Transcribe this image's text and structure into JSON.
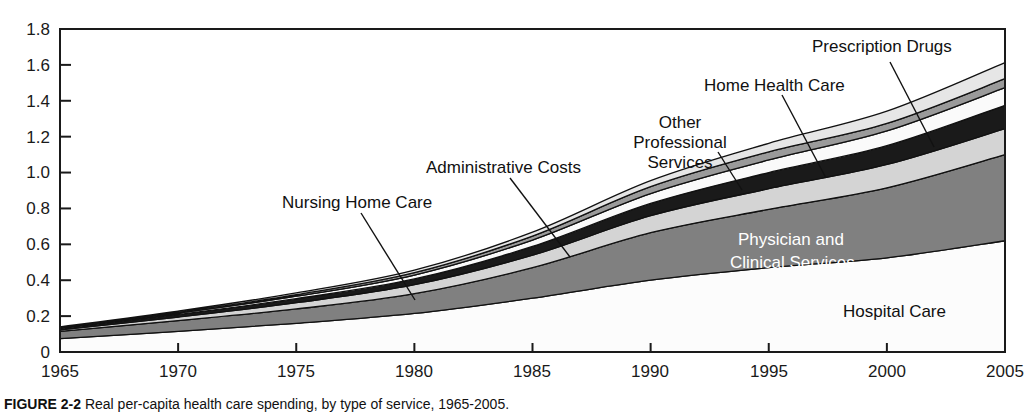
{
  "caption": {
    "figure_number": "FIGURE 2-2",
    "text": "Real per-capita health care spending, by type of service, 1965-2005."
  },
  "chart_data": {
    "type": "area",
    "stacked": true,
    "title": "",
    "xlabel": "",
    "ylabel": "",
    "xlim": [
      1965,
      2005
    ],
    "ylim": [
      0,
      1.8
    ],
    "grid": false,
    "legend_position": "in-plot annotations",
    "x_ticks": [
      "1965",
      "1970",
      "1975",
      "1980",
      "1985",
      "1990",
      "1995",
      "2000",
      "2005"
    ],
    "y_ticks": [
      "0",
      "0.2",
      "0.4",
      "0.6",
      "0.8",
      "1.0",
      "1.2",
      "1.4",
      "1.6",
      "1.8"
    ],
    "x": [
      1965,
      1970,
      1975,
      1980,
      1985,
      1990,
      1995,
      2000,
      2005
    ],
    "series": [
      {
        "name": "Hospital Care",
        "color": "#fcfcfc",
        "values": [
          0.075,
          0.115,
          0.16,
          0.215,
          0.3,
          0.4,
          0.47,
          0.525,
          0.62
        ]
      },
      {
        "name": "Physician and Clinical Services",
        "color": "#808080",
        "values": [
          0.04,
          0.06,
          0.08,
          0.11,
          0.17,
          0.265,
          0.325,
          0.39,
          0.48
        ]
      },
      {
        "name": "Nursing Home Care",
        "color": "#d4d4d4",
        "values": [
          0.008,
          0.02,
          0.035,
          0.05,
          0.07,
          0.095,
          0.115,
          0.13,
          0.145
        ]
      },
      {
        "name": "Administrative Costs",
        "color": "#1a1a1a",
        "values": [
          0.007,
          0.014,
          0.022,
          0.032,
          0.048,
          0.068,
          0.09,
          0.105,
          0.13
        ]
      },
      {
        "name": "Other Professional Services",
        "color": "#fafafa",
        "values": [
          0.004,
          0.008,
          0.014,
          0.022,
          0.036,
          0.055,
          0.07,
          0.082,
          0.098
        ]
      },
      {
        "name": "Home Health Care",
        "color": "#9a9a9a",
        "values": [
          0.002,
          0.004,
          0.008,
          0.013,
          0.022,
          0.038,
          0.045,
          0.042,
          0.05
        ]
      },
      {
        "name": "Prescription Drugs",
        "color": "#e6e6e6",
        "values": [
          0.004,
          0.007,
          0.01,
          0.014,
          0.022,
          0.034,
          0.048,
          0.068,
          0.09
        ]
      }
    ],
    "annotations": [
      {
        "label": "Nursing Home Care",
        "placement": "above-left"
      },
      {
        "label": "Administrative Costs",
        "placement": "above-center"
      },
      {
        "label": "Other Professional Services",
        "placement": "above-right"
      },
      {
        "label": "Home Health Care",
        "placement": "above-right"
      },
      {
        "label": "Prescription Drugs",
        "placement": "top-right"
      },
      {
        "label": "Physician and Clinical Services",
        "placement": "inside-band"
      },
      {
        "label": "Hospital Care",
        "placement": "inside-band"
      }
    ]
  },
  "annotation_text": {
    "nursing_home_care": "Nursing Home Care",
    "administrative_costs": "Administrative Costs",
    "other_professional_1": "Other",
    "other_professional_2": "Professional",
    "other_professional_3": "Services",
    "home_health_care": "Home Health Care",
    "prescription_drugs": "Prescription Drugs",
    "physician_1": "Physician and",
    "physician_2": "Clinical Services",
    "hospital_care": "Hospital Care"
  },
  "ticks": {
    "y": {
      "t0": "1.8",
      "t1": "1.6",
      "t2": "1.4",
      "t3": "1.2",
      "t4": "1.0",
      "t5": "0.8",
      "t6": "0.6",
      "t7": "0.4",
      "t8": "0.2",
      "t9": "0"
    },
    "x": {
      "t0": "1965",
      "t1": "1970",
      "t2": "1975",
      "t3": "1980",
      "t4": "1985",
      "t5": "1990",
      "t6": "1995",
      "t7": "2000",
      "t8": "2005"
    }
  }
}
